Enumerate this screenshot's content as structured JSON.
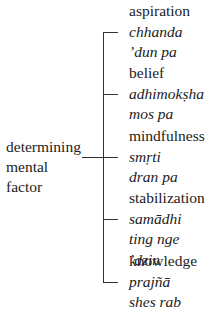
{
  "diagram": {
    "root": {
      "line1": "determining",
      "line2": "mental factor"
    },
    "branches": [
      {
        "english": "aspiration",
        "sanskrit": "chhanda",
        "tibetan": "’dun pa"
      },
      {
        "english": "belief",
        "sanskrit": "adhimokṣha",
        "tibetan": "mos pa"
      },
      {
        "english": "mindfulness",
        "sanskrit": "smṛti",
        "tibetan": "dran pa"
      },
      {
        "english": "stabilization",
        "sanskrit": "samādhi",
        "tibetan": "ting nge ’dzin"
      },
      {
        "english": "knowledge",
        "sanskrit": "prajñā",
        "tibetan": "shes rab"
      }
    ],
    "line_color": "#333333",
    "text_color": "#222222"
  }
}
